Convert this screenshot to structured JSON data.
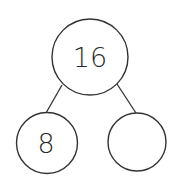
{
  "diagram": {
    "type": "number-bond",
    "colors": {
      "stroke": "#333333",
      "background": "#ffffff",
      "text": "#2a2a2a"
    },
    "whole": {
      "value": "16"
    },
    "parts": [
      {
        "value": "8"
      },
      {
        "value": ""
      }
    ]
  }
}
